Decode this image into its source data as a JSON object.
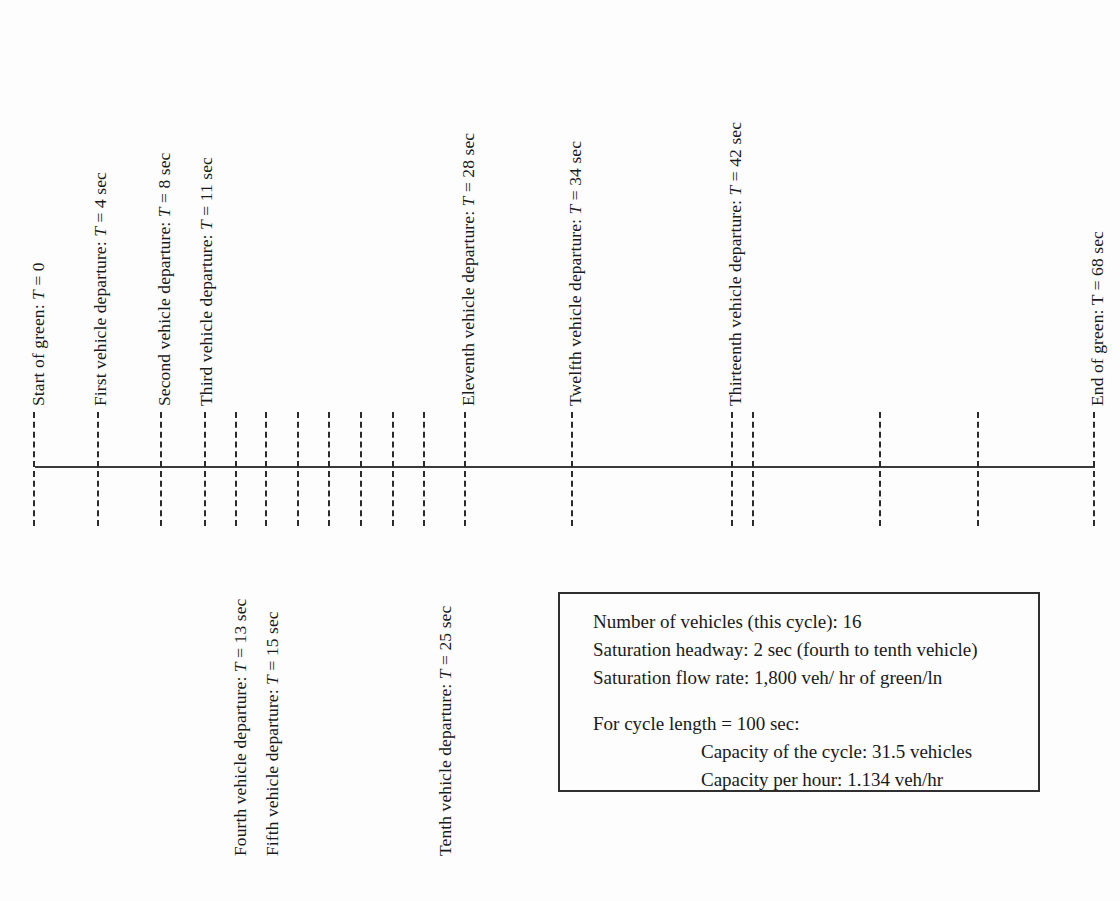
{
  "figure": {
    "type": "timeline-diagram",
    "background_color": "#fdfdfd",
    "line_color": "#3a3a3a",
    "tick_color": "#2b2b2b"
  },
  "axis": {
    "x_start_px": 35,
    "x_end_px": 1095,
    "y_px": 466,
    "tick_top_px": 412,
    "tick_bottom_px": 526
  },
  "ticks": [
    {
      "id": "tick-t0",
      "x": 33,
      "time_sec": 0,
      "labeled": true
    },
    {
      "id": "tick-t4",
      "x": 97,
      "time_sec": 4,
      "labeled": true
    },
    {
      "id": "tick-t8",
      "x": 160,
      "time_sec": 8,
      "labeled": true
    },
    {
      "id": "tick-t11",
      "x": 204,
      "time_sec": 11,
      "labeled": true
    },
    {
      "id": "tick-t13",
      "x": 235,
      "time_sec": 13,
      "labeled": true
    },
    {
      "id": "tick-t15",
      "x": 265,
      "time_sec": 15,
      "labeled": true
    },
    {
      "id": "tick-t17",
      "x": 297,
      "time_sec": 17,
      "labeled": false
    },
    {
      "id": "tick-t19",
      "x": 328,
      "time_sec": 19,
      "labeled": false
    },
    {
      "id": "tick-t21",
      "x": 360,
      "time_sec": 21,
      "labeled": false
    },
    {
      "id": "tick-t23",
      "x": 392,
      "time_sec": 23,
      "labeled": false
    },
    {
      "id": "tick-t25",
      "x": 423,
      "time_sec": 25,
      "labeled": true
    },
    {
      "id": "tick-t28",
      "x": 464,
      "time_sec": 28,
      "labeled": true
    },
    {
      "id": "tick-t34",
      "x": 571,
      "time_sec": 34,
      "labeled": true
    },
    {
      "id": "tick-t42",
      "x": 731,
      "time_sec": 42,
      "labeled": true
    },
    {
      "id": "tick-t43",
      "x": 752,
      "time_sec": 43,
      "labeled": false
    },
    {
      "id": "tick-t50",
      "x": 879,
      "time_sec": 50,
      "labeled": false
    },
    {
      "id": "tick-t56",
      "x": 977,
      "time_sec": 56,
      "labeled": false
    },
    {
      "id": "tick-t68",
      "x": 1093,
      "time_sec": 68,
      "labeled": true
    }
  ],
  "labels_above": [
    {
      "id": "label-start-of-green",
      "x": 30,
      "baseline_y": 406,
      "prefix": "Start of green: ",
      "symbol": "T",
      "italic_symbol": true,
      "suffix": " = 0"
    },
    {
      "id": "label-first-vehicle",
      "x": 92,
      "baseline_y": 406,
      "prefix": "First vehicle departure: ",
      "symbol": "T",
      "italic_symbol": true,
      "suffix": " = 4 sec"
    },
    {
      "id": "label-second-vehicle",
      "x": 156,
      "baseline_y": 406,
      "prefix": "Second vehicle departure: ",
      "symbol": "T",
      "italic_symbol": true,
      "suffix": " = 8 sec"
    },
    {
      "id": "label-third-vehicle",
      "x": 198,
      "baseline_y": 406,
      "prefix": "Third vehicle departure: ",
      "symbol": "T",
      "italic_symbol": true,
      "suffix": " = 11 sec"
    },
    {
      "id": "label-eleventh-vehicle",
      "x": 460,
      "baseline_y": 406,
      "prefix": "Eleventh vehicle departure: ",
      "symbol": "T",
      "italic_symbol": true,
      "suffix": " = 28 sec"
    },
    {
      "id": "label-twelfth-vehicle",
      "x": 567,
      "baseline_y": 406,
      "prefix": "Twelfth vehicle departure: ",
      "symbol": "T",
      "italic_symbol": true,
      "suffix": " = 34 sec"
    },
    {
      "id": "label-thirteenth-vehicle",
      "x": 727,
      "baseline_y": 406,
      "prefix": "Thirteenth vehicle departure: ",
      "symbol": "T",
      "italic_symbol": true,
      "suffix": " = 42 sec"
    },
    {
      "id": "label-end-of-green",
      "x": 1089,
      "baseline_y": 406,
      "prefix": "End of green: ",
      "symbol": "T",
      "italic_symbol": false,
      "suffix": " = 68 sec"
    }
  ],
  "labels_below": [
    {
      "id": "label-fourth-vehicle",
      "x": 232,
      "baseline_y": 856,
      "prefix": "Fourth vehicle departure: ",
      "symbol": "T",
      "italic_symbol": true,
      "suffix": " = 13 sec"
    },
    {
      "id": "label-fifth-vehicle",
      "x": 264,
      "baseline_y": 856,
      "prefix": "Fifth vehicle departure: ",
      "symbol": "T",
      "italic_symbol": true,
      "suffix": " = 15 sec"
    },
    {
      "id": "label-tenth-vehicle",
      "x": 437,
      "baseline_y": 856,
      "prefix": "Tenth vehicle departure: ",
      "symbol": "T",
      "italic_symbol": true,
      "suffix": " = 25 sec"
    }
  ],
  "info_box": {
    "lines": [
      {
        "id": "info-number-of-vehicles",
        "text": "Number of vehicles (this cycle): 16",
        "indent": false
      },
      {
        "id": "info-saturation-headway",
        "text": "Saturation headway: 2 sec (fourth to tenth vehicle)",
        "indent": false
      },
      {
        "id": "info-saturation-flow-rate",
        "text": "Saturation flow rate: 1,800 veh/ hr of green/ln",
        "indent": false
      },
      {
        "id": "info-spacer",
        "text": "",
        "indent": false,
        "spacer": true
      },
      {
        "id": "info-cycle-length",
        "text": "For cycle length  =  100 sec:",
        "indent": false
      },
      {
        "id": "info-capacity-of-cycle",
        "text": "Capacity of the cycle: 31.5 vehicles",
        "indent": true
      },
      {
        "id": "info-capacity-per-hour",
        "text": "Capacity per hour: 1.134 veh/hr",
        "indent": true
      }
    ]
  }
}
